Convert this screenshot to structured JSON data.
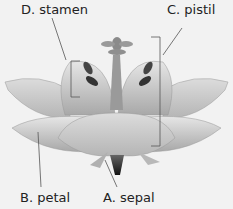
{
  "diagram": {
    "labels": {
      "stamen": "D. stamen",
      "pistil": "C. pistil",
      "petal": "B. petal",
      "sepal": "A. sepal"
    }
  }
}
